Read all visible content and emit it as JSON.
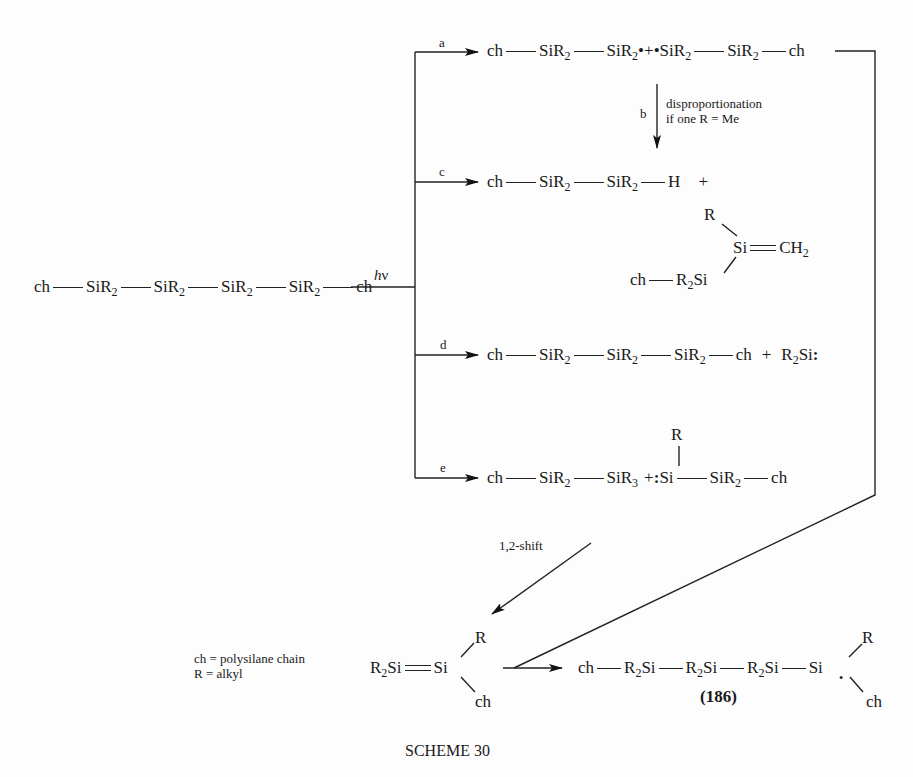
{
  "scheme_title": "SCHEME 30",
  "starting_material": {
    "groups": [
      "ch",
      "SiR",
      "SiR",
      "SiR",
      "SiR",
      "ch"
    ],
    "sub": "2"
  },
  "condition": {
    "h": "h",
    "nu": "ν"
  },
  "pathways": {
    "a": {
      "label": "a",
      "product": {
        "ch1": "ch",
        "si1": "SiR",
        "si2": "SiR",
        "rad": "•",
        "plus": "+",
        "rad2": "•",
        "si3": "SiR",
        "si4": "SiR",
        "ch2": "ch",
        "sub": "2"
      }
    },
    "b": {
      "label": "b",
      "note_line1": "disproportionation",
      "note_line2": "if one R = Me"
    },
    "c": {
      "label": "c",
      "product1": {
        "ch": "ch",
        "si1": "SiR",
        "si2": "SiR",
        "h": "H",
        "plus": "+",
        "sub": "2"
      },
      "product2": {
        "r": "R",
        "si": "Si",
        "ch2": "CH",
        "sub": "2",
        "chain": "ch",
        "r2si": "R",
        "r2si_sub": "2",
        "r2si_si": "Si"
      }
    },
    "d": {
      "label": "d",
      "product": {
        "ch1": "ch",
        "si1": "SiR",
        "si2": "SiR",
        "si3": "SiR",
        "ch2": "ch",
        "plus": "+",
        "silylene_r": "R",
        "silylene_sub": "2",
        "silylene_si": "Si",
        "colon": ":",
        "sub": "2"
      }
    },
    "e": {
      "label": "e",
      "product": {
        "ch1": "ch",
        "si1": "SiR",
        "sub": "2",
        "si2": "SiR",
        "sub3": "3",
        "plus": "+",
        "colon": ":",
        "si": "Si",
        "r": "R",
        "si3": "SiR",
        "ch2": "ch"
      }
    }
  },
  "shift_label": "1,2-shift",
  "legend": {
    "line1": "ch = polysilane chain",
    "line2": "R = alkyl"
  },
  "disilene": {
    "r2": "R",
    "sub": "2",
    "si1": "Si",
    "si2": "Si",
    "r": "R",
    "ch": "ch"
  },
  "final_product": {
    "ch": "ch",
    "r2si": "R",
    "sub": "2",
    "si": "Si",
    "last_si": "Si",
    "dot": "•",
    "r": "R",
    "ch2": "ch",
    "compound_number": "(186)"
  }
}
